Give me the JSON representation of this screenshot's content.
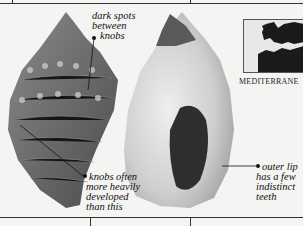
{
  "figure": {
    "annotations": [
      {
        "id": "dark-spots",
        "lines": [
          "dark spots",
          "between",
          "knobs"
        ]
      },
      {
        "id": "knobs",
        "lines": [
          "knobs often",
          "more heavily",
          "developed",
          "than this"
        ]
      },
      {
        "id": "outer-lip",
        "lines": [
          "outer lip",
          "has a few",
          "indistinct",
          "teeth"
        ]
      }
    ],
    "map": {
      "label": "MEDITERRANE"
    },
    "colors": {
      "background": "#f4f4f2",
      "shell_dark": "#5a5a5a",
      "shell_light": "#d8d8d8",
      "ink": "#111111"
    }
  }
}
